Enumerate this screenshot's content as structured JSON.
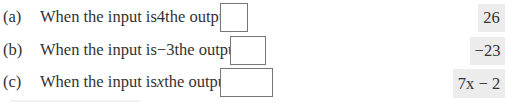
{
  "questions": [
    {
      "label": "(a)",
      "text_before": "When the input is ",
      "input_value": "4",
      "text_after": " the output is",
      "answer": "26"
    },
    {
      "label": "(b)",
      "text_before": "When the input is ",
      "input_value": "−3",
      "text_after": " the output is",
      "answer": "−23"
    },
    {
      "label": "(c)",
      "text_before": "When the input is ",
      "input_value": "x",
      "text_after": " the output is",
      "answer": "7x − 2"
    }
  ],
  "colors": {
    "answer_bg": "#ececec",
    "box_border": "#777777",
    "text": "#333333"
  }
}
